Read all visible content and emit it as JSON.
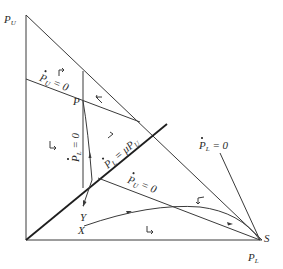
{
  "diagram": {
    "type": "phase-diagram",
    "axes": {
      "y_axis_label": "P",
      "y_axis_sub": "U",
      "x_axis_label": "P",
      "x_axis_sub": "L"
    },
    "points": {
      "P": "P",
      "S": "S",
      "X": "X",
      "Y": "Y"
    },
    "loci": {
      "pu_dot_zero_upper": {
        "var": "P",
        "sub": "U",
        "rhs": "= 0"
      },
      "pl_dot_zero_vertical": {
        "var": "P",
        "sub": "L",
        "rhs": "= 0"
      },
      "pl_dot_mu_pu": {
        "var": "P",
        "sub": "L",
        "rhs": "= μP",
        "rhs_sub": "U"
      },
      "pu_dot_zero_lower": {
        "var": "P",
        "sub": "U",
        "rhs": "= 0"
      },
      "pl_dot_zero_right": {
        "var": "P",
        "sub": "L",
        "rhs": "= 0"
      }
    },
    "colors": {
      "line": "#3a3a3a",
      "thick_line": "#1e1e1e",
      "background": "#ffffff"
    }
  }
}
